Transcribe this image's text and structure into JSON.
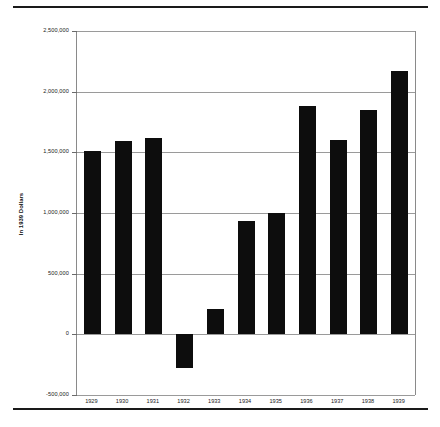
{
  "chart_data": {
    "type": "bar",
    "title": "",
    "xlabel": "",
    "ylabel": "In 1939 Dollars",
    "categories": [
      "1929",
      "1930",
      "1931",
      "1932",
      "1933",
      "1934",
      "1935",
      "1936",
      "1937",
      "1938",
      "1939"
    ],
    "values": [
      1510000,
      1590000,
      1620000,
      -280000,
      205000,
      935000,
      1000000,
      1880000,
      1600000,
      1850000,
      2170000
    ],
    "ylim": [
      -500000,
      2500000
    ],
    "ytick_values": [
      2500000,
      2000000,
      1500000,
      1000000,
      500000,
      0,
      -500000
    ],
    "ytick_labels": [
      "2,500,000",
      "2,000,000",
      "1,500,000",
      "1,000,000",
      "500,000",
      "0",
      "-500,000"
    ],
    "grid": true,
    "legend": null,
    "bar_color": "#0d0d0d",
    "grid_color": "#9a9a9a",
    "axis_color": "#8a8a8a"
  },
  "page": {
    "top_rule_color": "#1a1a1a",
    "bottom_rule_color": "#1a1a1a",
    "background": "#ffffff"
  }
}
